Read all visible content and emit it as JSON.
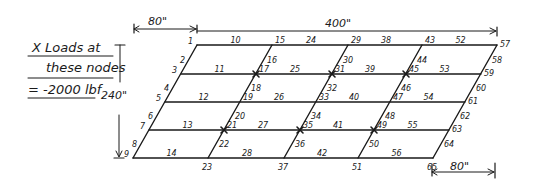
{
  "legend": {
    "line1": "X Loads at",
    "line2": "these nodes",
    "line3": "= -2000 lbf",
    "marker": "X"
  },
  "dimensions": {
    "top_offset": "80\"",
    "top_width": "400\"",
    "height": "240\"",
    "bottom_offset": "80\""
  },
  "grid": {
    "rows": 5,
    "columns": 5,
    "row_y": [
      45,
      74,
      102,
      130,
      158
    ],
    "top_x": [
      197,
      272,
      348,
      422,
      497
    ],
    "row_shift": [
      0,
      -16,
      -32,
      -48,
      -64
    ]
  },
  "nodes": [
    {
      "id": "1",
      "col": 0,
      "row": 0
    },
    {
      "id": "3",
      "col": 0,
      "row": 1
    },
    {
      "id": "5",
      "col": 0,
      "row": 2
    },
    {
      "id": "7",
      "col": 0,
      "row": 3
    },
    {
      "id": "9",
      "col": 0,
      "row": 4
    },
    {
      "id": "15",
      "col": 1,
      "row": 0
    },
    {
      "id": "17",
      "col": 1,
      "row": 1
    },
    {
      "id": "19",
      "col": 1,
      "row": 2
    },
    {
      "id": "21",
      "col": 1,
      "row": 3
    },
    {
      "id": "23",
      "col": 1,
      "row": 4
    },
    {
      "id": "29",
      "col": 2,
      "row": 0
    },
    {
      "id": "31",
      "col": 2,
      "row": 1
    },
    {
      "id": "33",
      "col": 2,
      "row": 2
    },
    {
      "id": "35",
      "col": 2,
      "row": 3
    },
    {
      "id": "37",
      "col": 2,
      "row": 4
    },
    {
      "id": "43",
      "col": 3,
      "row": 0
    },
    {
      "id": "45",
      "col": 3,
      "row": 1
    },
    {
      "id": "47",
      "col": 3,
      "row": 2
    },
    {
      "id": "49",
      "col": 3,
      "row": 3
    },
    {
      "id": "51",
      "col": 3,
      "row": 4
    },
    {
      "id": "57",
      "col": 4,
      "row": 0
    },
    {
      "id": "59",
      "col": 4,
      "row": 1
    },
    {
      "id": "61",
      "col": 4,
      "row": 2
    },
    {
      "id": "63",
      "col": 4,
      "row": 3
    },
    {
      "id": "65",
      "col": 4,
      "row": 4
    }
  ],
  "loaded_nodes": [
    "17",
    "31",
    "45",
    "21",
    "35",
    "49"
  ],
  "horizontal_members": [
    {
      "row": 0,
      "labels": [
        "10",
        "24",
        "38",
        "52"
      ]
    },
    {
      "row": 1,
      "labels": [
        "11",
        "25",
        "39",
        "53"
      ]
    },
    {
      "row": 2,
      "labels": [
        "12",
        "26",
        "40",
        "54"
      ]
    },
    {
      "row": 3,
      "labels": [
        "13",
        "27",
        "41",
        "55"
      ]
    },
    {
      "row": 4,
      "labels": [
        "14",
        "28",
        "42",
        "56"
      ]
    }
  ],
  "slanted_members": [
    {
      "col": 0,
      "labels": [
        "2",
        "4",
        "6",
        "8"
      ]
    },
    {
      "col": 1,
      "labels": [
        "16",
        "18",
        "20",
        "22"
      ]
    },
    {
      "col": 2,
      "labels": [
        "30",
        "32",
        "34",
        "36"
      ]
    },
    {
      "col": 3,
      "labels": [
        "44",
        "46",
        "48",
        "50"
      ]
    },
    {
      "col": 4,
      "labels": [
        "58",
        "60",
        "62",
        "64"
      ]
    }
  ]
}
